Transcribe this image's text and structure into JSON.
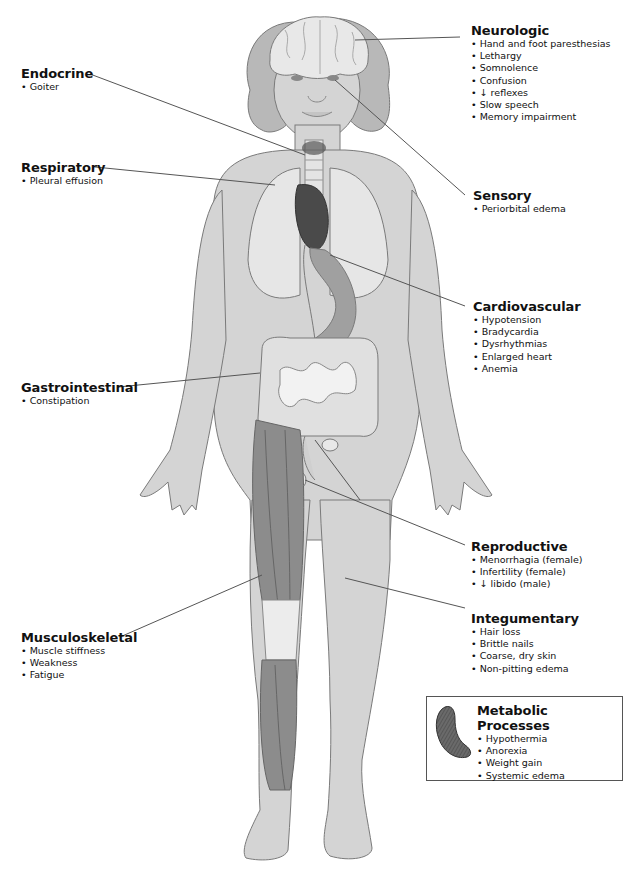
{
  "diagram": {
    "systems": {
      "neurologic": {
        "title": "Neurologic",
        "items": [
          "Hand and foot paresthesias",
          "Lethargy",
          "Somnolence",
          "Confusion",
          "↓ reflexes",
          "Slow speech",
          "Memory impairment"
        ]
      },
      "endocrine": {
        "title": "Endocrine",
        "items": [
          "Goiter"
        ]
      },
      "respiratory": {
        "title": "Respiratory",
        "items": [
          "Pleural effusion"
        ]
      },
      "sensory": {
        "title": "Sensory",
        "items": [
          "Periorbital edema"
        ]
      },
      "cardiovascular": {
        "title": "Cardiovascular",
        "items": [
          "Hypotension",
          "Bradycardia",
          "Dysrhythmias",
          "Enlarged heart",
          "Anemia"
        ]
      },
      "gastrointestinal": {
        "title": "Gastrointestinal",
        "items": [
          "Constipation"
        ]
      },
      "reproductive": {
        "title": "Reproductive",
        "items": [
          "Menorrhagia (female)",
          "Infertility (female)",
          "↓ libido (male)"
        ]
      },
      "integumentary": {
        "title": "Integumentary",
        "items": [
          "Hair loss",
          "Brittle nails",
          "Coarse, dry skin",
          "Non-pitting edema"
        ]
      },
      "musculoskeletal": {
        "title": "Musculoskeletal",
        "items": [
          "Muscle stiffness",
          "Weakness",
          "Fatigue"
        ]
      },
      "metabolic": {
        "title": "Metabolic Processes",
        "items": [
          "Hypothermia",
          "Anorexia",
          "Weight gain",
          "Systemic edema"
        ]
      }
    },
    "colors": {
      "skin": "#d4d4d4",
      "outline": "#7a7a7a",
      "hair": "#b8b8b8",
      "brain": "#e8e8e8",
      "lungs": "#e6e6e6",
      "heart": "#4a4a4a",
      "stomach": "#a0a0a0",
      "intestine": "#e0e0e0",
      "muscle": "#8c8c8c",
      "leader_line": "#555555"
    }
  }
}
